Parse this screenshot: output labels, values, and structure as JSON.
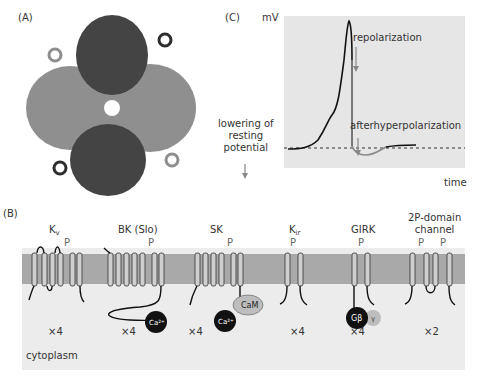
{
  "panels": {
    "A": {
      "letter": "(A)"
    },
    "C": {
      "letter": "(C)",
      "y_axis_label": "mV",
      "x_axis_label": "time",
      "annotations": {
        "repolarization": "repolarization",
        "afterhyperpolarization": "afterhyperpolarization",
        "lowering": [
          "lowering of",
          "resting",
          "potential"
        ]
      }
    },
    "B": {
      "letter": "(B)",
      "region_label": "cytoplasm",
      "channels": [
        {
          "name": "K",
          "sub": "v",
          "p_labels": [
            "P"
          ],
          "multiplicity": "×4"
        },
        {
          "name": "BK (Slo)",
          "sub": "",
          "p_labels": [
            "P"
          ],
          "multiplicity": "×4",
          "ligand": "Ca2+"
        },
        {
          "name": "SK",
          "sub": "",
          "p_labels": [
            "P"
          ],
          "multiplicity": "×4",
          "ligands": [
            "Ca2+",
            "CaM"
          ]
        },
        {
          "name": "K",
          "sub": "ir",
          "p_labels": [
            "P"
          ],
          "multiplicity": "×4"
        },
        {
          "name": "GIRK",
          "sub": "",
          "p_labels": [
            "P"
          ],
          "multiplicity": "×4",
          "ligands": [
            "Gβ",
            "γ"
          ]
        },
        {
          "name": "2P-domain",
          "name2": "channel",
          "sub": "",
          "p_labels": [
            "P",
            "P"
          ],
          "multiplicity": "×2"
        }
      ]
    }
  },
  "colors": {
    "membrane": "#a9a9a9",
    "cytoplasm": "#ececec",
    "plot_bg": "#e6e6e6",
    "trace": "#111111",
    "grey_trace": "#888888"
  }
}
